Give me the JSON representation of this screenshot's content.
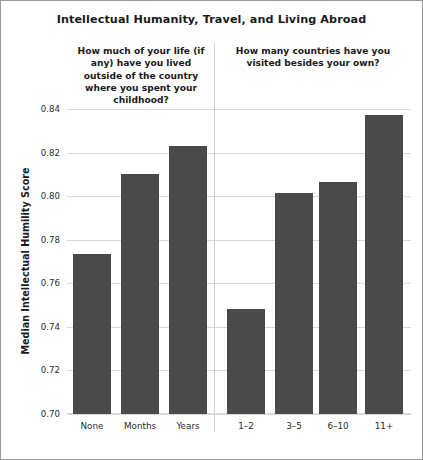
{
  "chart_data": {
    "type": "bar",
    "title": "Intellectual Humanity, Travel, and Living Abroad",
    "xlabel": "",
    "ylabel": "Median Intellectual Humility Score",
    "ylim": [
      0.7,
      0.84
    ],
    "ytick_labels": [
      "0.84",
      "0.82",
      "0.80",
      "0.78",
      "0.76",
      "0.74",
      "0.72",
      "0.70"
    ],
    "yticks": [
      0.84,
      0.82,
      0.8,
      0.78,
      0.76,
      0.74,
      0.72,
      0.7
    ],
    "grid": true,
    "legend": "none",
    "bar_color": "#4a4a4a",
    "panels": [
      {
        "name": "living-abroad",
        "subtitle": "How much of your life (if any) have you lived outside of the country where you spent your childhood?",
        "categories": [
          "None",
          "Months",
          "Years"
        ],
        "values": [
          0.7735,
          0.8101,
          0.823
        ]
      },
      {
        "name": "countries-visited",
        "subtitle": "How many countries have you visited besides your own?",
        "categories": [
          "1–2",
          "3–5",
          "6–10",
          "11+"
        ],
        "values": [
          0.7482,
          0.8015,
          0.8065,
          0.8372
        ]
      }
    ]
  }
}
